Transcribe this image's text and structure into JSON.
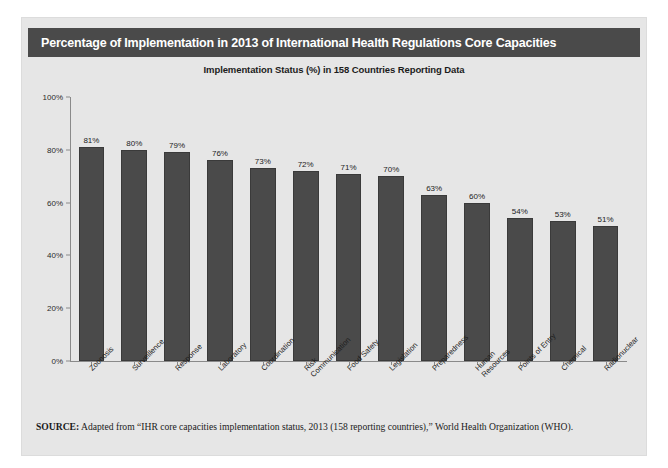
{
  "figure": {
    "title": "Percentage of Implementation in 2013 of International Health Regulations Core Capacities",
    "subtitle": "Implementation Status (%) in 158 Countries Reporting Data",
    "source_label": "SOURCE:",
    "source_text": " Adapted from “IHR core capacities implementation status, 2013 (158 reporting countries),” World Health Organization (WHO).",
    "colors": {
      "title_bar": "#4a4a4a",
      "card_background": "#e6e6e6",
      "bar_fill": "#4a4a4a",
      "axis": "#8a8a8a",
      "text": "#1c1c1c"
    }
  },
  "chart_data": {
    "type": "bar",
    "title": "Implementation Status (%) in 158 Countries Reporting Data",
    "xlabel": "",
    "ylabel": "",
    "ylim": [
      0,
      100
    ],
    "grid": false,
    "legend": "none",
    "ytick_labels": [
      "100%",
      "80%",
      "60%",
      "40%",
      "20%",
      "0%"
    ],
    "ytick_values": [
      100,
      80,
      60,
      40,
      20,
      0
    ],
    "categories": [
      "Zoonosis",
      "Surveillence",
      "Response",
      "Laboratory",
      "Coordination",
      "Risk\nCommunication",
      "Food Safety",
      "Legislation",
      "Preparedness",
      "Human\nResources",
      "Points of Entry",
      "Chemical",
      "Radionuclear"
    ],
    "values": [
      81,
      80,
      79,
      76,
      73,
      72,
      71,
      70,
      63,
      60,
      54,
      53,
      51
    ],
    "value_labels": [
      "81%",
      "80%",
      "79%",
      "76%",
      "73%",
      "72%",
      "71%",
      "70%",
      "63%",
      "60%",
      "54%",
      "53%",
      "51%"
    ]
  }
}
